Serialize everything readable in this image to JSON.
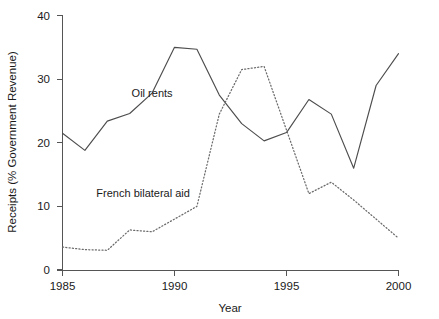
{
  "chart_data": {
    "type": "line",
    "title": "",
    "xlabel": "Year",
    "ylabel": "Receipts (% Government Revenue)",
    "xlim": [
      1985,
      2000
    ],
    "ylim": [
      0,
      40
    ],
    "xticks": [
      1985,
      1990,
      1995,
      2000
    ],
    "yticks": [
      0,
      10,
      20,
      30,
      40
    ],
    "grid": false,
    "legend_position": "inline-annotations",
    "x": [
      1985,
      1986,
      1987,
      1988,
      1989,
      1990,
      1991,
      1992,
      1993,
      1994,
      1995,
      1996,
      1997,
      1998,
      1999,
      2000
    ],
    "series": [
      {
        "name": "Oil rents",
        "style": "solid",
        "color": "#4d4d4d",
        "values": [
          21.5,
          18.8,
          23.4,
          24.6,
          27.8,
          35.0,
          34.7,
          27.5,
          23.0,
          20.3,
          21.6,
          26.8,
          24.5,
          16.0,
          29.0,
          34.0
        ]
      },
      {
        "name": "French bilateral aid",
        "style": "dotted",
        "color": "#6b6b6b",
        "values": [
          3.6,
          3.2,
          3.1,
          6.3,
          6.0,
          8.0,
          10.0,
          24.5,
          31.5,
          32.0,
          22.0,
          12.0,
          13.8,
          11.0,
          8.0,
          5.0
        ]
      }
    ],
    "annotations": [
      {
        "text": "Oil rents",
        "x": 1989.0,
        "y": 27.2
      },
      {
        "text": "French bilateral aid",
        "x": 1988.6,
        "y": 11.4
      }
    ]
  },
  "axis": {
    "y_tick_labels": [
      "40",
      "30",
      "20",
      "10",
      "0"
    ],
    "x_tick_labels": [
      "1985",
      "1990",
      "1995",
      "2000"
    ],
    "x_title": "Year",
    "y_title": "Receipts (% Government Revenue)"
  }
}
